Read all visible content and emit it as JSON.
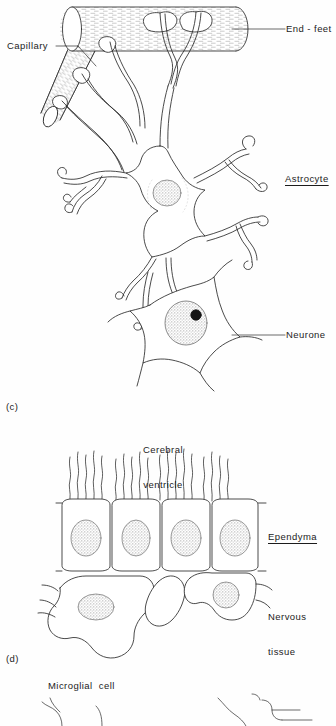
{
  "figure": {
    "ink_color": "#2b2b2b",
    "nucleus_fill": "#d8d8d8",
    "background": "#fefefe"
  },
  "panels": [
    {
      "tag": "(c)",
      "name": "panel-c",
      "subject": "Astrocyte and neurone with capillary"
    },
    {
      "tag": "(d)",
      "name": "panel-d",
      "subject": "Ependyma lining cerebral ventricle"
    }
  ],
  "labels": {
    "end_feet": "End - feet",
    "capillary": "Capillary",
    "astrocyte": "Astrocyte",
    "neurone": "Neurone",
    "cerebral_ventricle_line1": "Cerebral",
    "cerebral_ventricle_line2": "ventricle",
    "ependyma": "Ependyma",
    "nervous_tissue_line1": "Nervous",
    "nervous_tissue_line2": "tissue",
    "microglial_cell": "Microglial  cell",
    "panel_c_tag": "(c)",
    "panel_d_tag": "(d)"
  },
  "structures": {
    "capillary": {
      "name": "capillary-vessel",
      "description": "Branched hatched tube running horizontally with a diagonal branch to lower left",
      "end_feet_count": 5
    },
    "astrocyte": {
      "name": "astrocyte-cell",
      "description": "Star shaped glial cell with many branching processes ending in end-feet",
      "nucleus": "stippled round nucleus",
      "process_count": 8
    },
    "neurone": {
      "name": "neurone-cell",
      "description": "Large polygonal cell body with stippled nucleus and dark nucleolus",
      "nucleolus": "solid black dot"
    },
    "ependyma": {
      "name": "ependyma-layer",
      "description": "Row of four columnar ciliated cells with stippled oval nuclei",
      "cell_count": 4,
      "cilia_per_cell": 5
    },
    "nervous_tissue": {
      "name": "nervous-tissue-layer",
      "description": "Irregular lobed cells beneath ependyma with two stippled nuclei",
      "cell_count": 3
    },
    "microglial_cell": {
      "name": "microglial-cell",
      "description": "Partially visible cell with fine wavy branching processes at the bottom edge"
    }
  }
}
